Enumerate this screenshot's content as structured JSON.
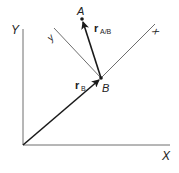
{
  "diagram": {
    "type": "relative-position-vectors",
    "colors": {
      "axis": "#6e6e6e",
      "vector": "#1a1a1a",
      "text": "#222222"
    },
    "fixed_frame": {
      "x_label": "X",
      "y_label": "Y"
    },
    "moving_frame": {
      "x_label": "x",
      "y_label": "y"
    },
    "points": {
      "A": {
        "label": "A"
      },
      "B": {
        "label": "B"
      }
    },
    "vectors": {
      "r_B": {
        "symbol": "r",
        "subscript": "B"
      },
      "r_A_B": {
        "symbol": "r",
        "subscript": "A/B"
      }
    }
  }
}
